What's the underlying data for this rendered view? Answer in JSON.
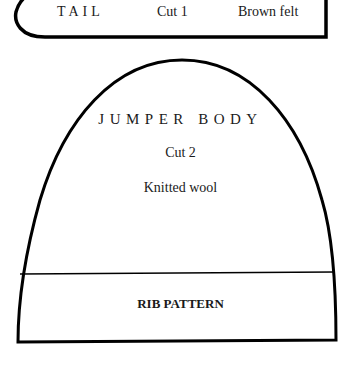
{
  "tail_piece": {
    "title": "TAIL",
    "cut": "Cut 1",
    "material": "Brown felt"
  },
  "jumper_body_piece": {
    "title": "JUMPER BODY",
    "cut": "Cut 2",
    "material": "Knitted wool",
    "rib_section_label": "RIB PATTERN"
  },
  "colors": {
    "outline": "#000000",
    "background": "#ffffff",
    "text": "#1a1a1a"
  }
}
